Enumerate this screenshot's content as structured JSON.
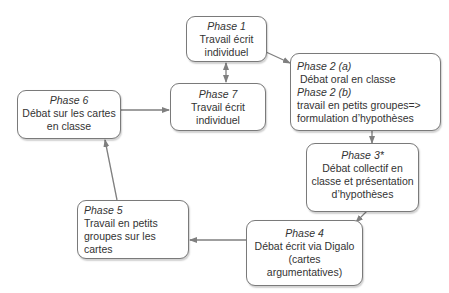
{
  "diagram": {
    "type": "cycle-flowchart",
    "colors": {
      "box_border": "#7a7a7a",
      "arrow": "#7f7f7f",
      "text": "#333333",
      "background": "#ffffff"
    },
    "nodes": [
      {
        "id": "phase1",
        "title": "Phase 1",
        "lines": [
          "Travail écrit",
          "individuel"
        ]
      },
      {
        "id": "phase2",
        "title_a": "Phase 2 (a)",
        "line_a": " Débat oral en classe",
        "title_b": "Phase 2 (b)",
        "lines_b": [
          "travail en petits groupes=>",
          "formulation d’hypothèses"
        ]
      },
      {
        "id": "phase3",
        "title": "Phase 3*",
        "lines": [
          "Débat collectif en",
          "classe et présentation",
          "d’hypothèses"
        ]
      },
      {
        "id": "phase4",
        "title": "Phase 4",
        "lines": [
          "Débat écrit via Digalo",
          "(cartes",
          "argumentatives)"
        ]
      },
      {
        "id": "phase5",
        "title": "Phase 5",
        "lines": [
          "Travail en petits",
          "groupes sur les",
          "cartes"
        ]
      },
      {
        "id": "phase6",
        "title": "Phase 6",
        "lines": [
          "Débat sur les cartes",
          "en classe"
        ]
      },
      {
        "id": "phase7",
        "title": "Phase 7",
        "lines": [
          "Travail écrit",
          "individuel"
        ]
      }
    ],
    "edges": [
      {
        "from": "phase1",
        "to": "phase2",
        "type": "arrow"
      },
      {
        "from": "phase2",
        "to": "phase3",
        "type": "arrow"
      },
      {
        "from": "phase3",
        "to": "phase4",
        "type": "arrow"
      },
      {
        "from": "phase4",
        "to": "phase5",
        "type": "arrow"
      },
      {
        "from": "phase5",
        "to": "phase6",
        "type": "arrow"
      },
      {
        "from": "phase6",
        "to": "phase7",
        "type": "arrow"
      },
      {
        "from": "phase1",
        "to": "phase7",
        "type": "bidirectional"
      }
    ]
  }
}
